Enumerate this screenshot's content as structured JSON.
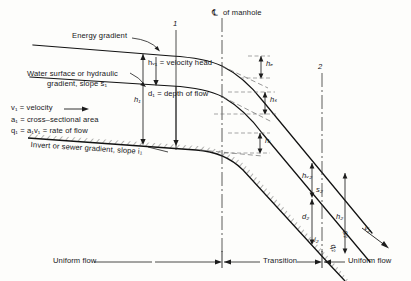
{
  "figure": {
    "domain": "engineering-diagram",
    "title_text": "",
    "colors": {
      "background": "#fdfdfb",
      "ink": "#17171a",
      "line": "#111111",
      "dash_guide": "#555555"
    }
  },
  "labels": {
    "energy_gradient": "Energy gradient",
    "water_surface_line1": "Water surface or hydraulic",
    "water_surface_line2": "gradient, slope s₁",
    "velocity_def": "v₁ = velocity",
    "area_def": "a₁ = cross–sectional area",
    "rate_def": "q₁ = a₁v₁ = rate of flow",
    "invert_gradient": "Invert or sewer gradient, slope i₁",
    "velocity_head": "hᵥ₁ = velocity head",
    "depth_of_flow": "d₁ = depth of flow",
    "centerline_of_manhole": "of manhole",
    "centerline_symbol": "℄"
  },
  "dimension_labels": {
    "h1": "h₁",
    "he": "hₑ",
    "hs": "hₛ",
    "hi": "hᵢ",
    "hv2": "hᵥ₂",
    "s2": "s₂",
    "d2": "d₂",
    "h2": "h₂",
    "i2": "i₂",
    "v2": "v₂",
    "a2": "a₂",
    "q2": "q₂"
  },
  "section_markers": {
    "section_1": "1",
    "section_2": "2"
  },
  "flow_regions": {
    "left": "Uniform flow",
    "middle": "Transition",
    "right": "Uniform flow"
  }
}
